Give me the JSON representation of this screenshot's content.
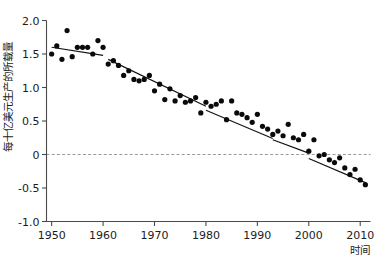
{
  "chart_data": {
    "type": "scatter",
    "title": "",
    "xlabel": "时间",
    "ylabel": "每十亿美元生产的所载量",
    "xlim": [
      1949,
      2012
    ],
    "ylim": [
      -1.0,
      2.0
    ],
    "grid": false,
    "legend": false,
    "xticks": [
      1950,
      1960,
      1970,
      1980,
      1990,
      2000,
      2010
    ],
    "xticklabels": [
      "1950",
      "1960",
      "1970",
      "1980",
      "1990",
      "2000",
      "2010"
    ],
    "yticks": [
      -1.0,
      -0.5,
      0,
      0.5,
      1.0,
      1.5,
      2.0
    ],
    "yticklabels": [
      "-1.0",
      "-0.5",
      "0",
      "0.5",
      "1.0",
      "1.5",
      "2.0"
    ],
    "annotations": [
      {
        "name": "zero-reference-line",
        "type": "hline",
        "y": 0,
        "style": "dashed",
        "color": "#9a9a9a"
      }
    ],
    "series": [
      {
        "name": "observations",
        "marker": "circle",
        "color": "#0a0a0a",
        "x": [
          1950,
          1951,
          1952,
          1953,
          1954,
          1955,
          1956,
          1957,
          1958,
          1959,
          1960,
          1961,
          1962,
          1963,
          1964,
          1965,
          1966,
          1967,
          1968,
          1969,
          1970,
          1971,
          1972,
          1973,
          1974,
          1975,
          1976,
          1977,
          1978,
          1979,
          1980,
          1981,
          1982,
          1983,
          1984,
          1985,
          1986,
          1987,
          1988,
          1989,
          1990,
          1991,
          1992,
          1993,
          1994,
          1995,
          1996,
          1997,
          1998,
          1999,
          2000,
          2001,
          2002,
          2003,
          2004,
          2005,
          2006,
          2007,
          2008,
          2009,
          2010,
          2011
        ],
        "y": [
          1.5,
          1.62,
          1.42,
          1.85,
          1.46,
          1.6,
          1.6,
          1.6,
          1.5,
          1.7,
          1.6,
          1.35,
          1.4,
          1.33,
          1.18,
          1.25,
          1.12,
          1.1,
          1.12,
          1.18,
          0.95,
          1.05,
          0.82,
          0.98,
          0.8,
          0.88,
          0.78,
          0.8,
          0.85,
          0.62,
          0.78,
          0.72,
          0.75,
          0.8,
          0.52,
          0.8,
          0.62,
          0.6,
          0.55,
          0.48,
          0.6,
          0.42,
          0.38,
          0.3,
          0.35,
          0.28,
          0.45,
          0.25,
          0.22,
          0.3,
          0.05,
          0.22,
          -0.02,
          0.0,
          -0.08,
          -0.12,
          -0.05,
          -0.2,
          -0.3,
          -0.22,
          -0.38,
          -0.45
        ]
      },
      {
        "name": "piecewise-trend-line",
        "type": "line",
        "color": "#111111",
        "segments": [
          {
            "x": [
              1950,
              1960
            ],
            "y": [
              1.6,
              1.48
            ]
          },
          {
            "x": [
              1961,
              1980
            ],
            "y": [
              1.42,
              0.72
            ]
          },
          {
            "x": [
              1980,
              1993
            ],
            "y": [
              0.66,
              0.24
            ]
          },
          {
            "x": [
              1993,
              2000
            ],
            "y": [
              0.22,
              0.02
            ]
          },
          {
            "x": [
              2000,
              2011
            ],
            "y": [
              -0.06,
              -0.42
            ]
          }
        ]
      }
    ]
  }
}
